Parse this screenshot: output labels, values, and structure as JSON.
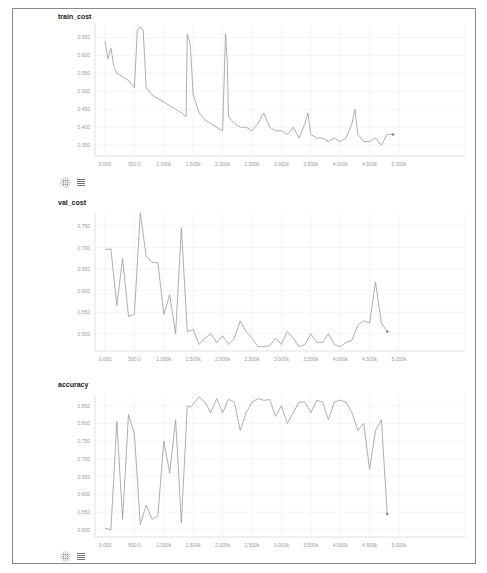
{
  "panels": [
    {
      "title": "train_cost",
      "yticks": [
        "0.650",
        "0.600",
        "0.550",
        "0.500",
        "0.450",
        "0.400",
        "0.350"
      ],
      "xticks": [
        "0.000",
        "500.0",
        "1.000k",
        "1.500k",
        "2.000k",
        "2.500k",
        "3.000k",
        "3.500k",
        "4.000k",
        "4.500k",
        "5.000k"
      ]
    },
    {
      "title": "val_cost",
      "yticks": [
        "0.750",
        "0.700",
        "0.650",
        "0.600",
        "0.550",
        "0.500"
      ],
      "xticks": [
        "0.000",
        "500.0",
        "1.000k",
        "1.500k",
        "2.000k",
        "2.500k",
        "3.000k",
        "3.500k",
        "4.000k",
        "4.500k",
        "5.000k"
      ]
    },
    {
      "title": "accuracy",
      "yticks": [
        "0.850",
        "0.800",
        "0.750",
        "0.700",
        "0.650",
        "0.600",
        "0.550",
        "0.500"
      ],
      "xticks": [
        "0.000",
        "500.0",
        "1.000k",
        "1.500k",
        "2.000k",
        "2.500k",
        "3.000k",
        "3.500k",
        "4.000k",
        "4.500k",
        "5.000k"
      ]
    }
  ],
  "icons": [
    "fit-domain-icon",
    "data-table-icon"
  ],
  "chart_data": [
    {
      "type": "line",
      "title": "train_cost",
      "xlabel": "",
      "ylabel": "",
      "xlim": [
        0,
        5000
      ],
      "ylim": [
        0.32,
        0.69
      ],
      "grid": true,
      "x": [
        0,
        50,
        100,
        150,
        200,
        300,
        400,
        500,
        550,
        600,
        650,
        700,
        800,
        900,
        1000,
        1100,
        1200,
        1300,
        1380,
        1400,
        1450,
        1500,
        1600,
        1700,
        1800,
        1900,
        2000,
        2050,
        2080,
        2100,
        2150,
        2200,
        2300,
        2400,
        2500,
        2600,
        2700,
        2800,
        2900,
        3000,
        3100,
        3200,
        3300,
        3400,
        3450,
        3500,
        3600,
        3700,
        3800,
        3900,
        4000,
        4100,
        4200,
        4250,
        4300,
        4400,
        4500,
        4600,
        4700,
        4800,
        4900
      ],
      "values": [
        0.64,
        0.59,
        0.62,
        0.57,
        0.55,
        0.54,
        0.53,
        0.51,
        0.67,
        0.68,
        0.67,
        0.51,
        0.49,
        0.48,
        0.47,
        0.46,
        0.45,
        0.44,
        0.43,
        0.66,
        0.63,
        0.49,
        0.44,
        0.42,
        0.41,
        0.4,
        0.39,
        0.66,
        0.58,
        0.43,
        0.42,
        0.41,
        0.4,
        0.4,
        0.39,
        0.41,
        0.44,
        0.4,
        0.39,
        0.39,
        0.38,
        0.4,
        0.37,
        0.41,
        0.44,
        0.38,
        0.37,
        0.37,
        0.36,
        0.37,
        0.36,
        0.37,
        0.41,
        0.45,
        0.38,
        0.36,
        0.36,
        0.37,
        0.35,
        0.38,
        0.38
      ]
    },
    {
      "type": "line",
      "title": "val_cost",
      "xlabel": "",
      "ylabel": "",
      "xlim": [
        0,
        5000
      ],
      "ylim": [
        0.46,
        0.78
      ],
      "grid": true,
      "x": [
        0,
        100,
        200,
        300,
        400,
        500,
        600,
        700,
        800,
        900,
        1000,
        1100,
        1200,
        1300,
        1400,
        1500,
        1600,
        1700,
        1800,
        1900,
        2000,
        2100,
        2200,
        2300,
        2400,
        2500,
        2600,
        2700,
        2800,
        2900,
        3000,
        3100,
        3200,
        3300,
        3400,
        3500,
        3600,
        3700,
        3800,
        3900,
        4000,
        4100,
        4200,
        4300,
        4400,
        4500,
        4600,
        4700,
        4800
      ],
      "values": [
        0.695,
        0.697,
        0.565,
        0.675,
        0.54,
        0.545,
        0.78,
        0.68,
        0.665,
        0.665,
        0.545,
        0.59,
        0.5,
        0.745,
        0.505,
        0.51,
        0.475,
        0.49,
        0.5,
        0.48,
        0.495,
        0.475,
        0.49,
        0.53,
        0.505,
        0.49,
        0.47,
        0.47,
        0.472,
        0.49,
        0.475,
        0.505,
        0.49,
        0.47,
        0.475,
        0.5,
        0.48,
        0.48,
        0.5,
        0.475,
        0.47,
        0.48,
        0.485,
        0.52,
        0.53,
        0.525,
        0.62,
        0.525,
        0.505
      ]
    },
    {
      "type": "line",
      "title": "accuracy",
      "xlabel": "",
      "ylabel": "",
      "xlim": [
        0,
        5000
      ],
      "ylim": [
        0.48,
        0.88
      ],
      "grid": true,
      "x": [
        0,
        100,
        200,
        300,
        400,
        500,
        600,
        700,
        800,
        900,
        1000,
        1100,
        1200,
        1300,
        1400,
        1450,
        1500,
        1600,
        1700,
        1800,
        1900,
        2000,
        2100,
        2200,
        2300,
        2400,
        2500,
        2600,
        2700,
        2800,
        2900,
        3000,
        3100,
        3200,
        3300,
        3400,
        3500,
        3600,
        3700,
        3800,
        3900,
        4000,
        4100,
        4200,
        4300,
        4400,
        4500,
        4600,
        4700,
        4800
      ],
      "values": [
        0.505,
        0.5,
        0.805,
        0.53,
        0.825,
        0.77,
        0.515,
        0.57,
        0.53,
        0.54,
        0.75,
        0.66,
        0.81,
        0.52,
        0.85,
        0.845,
        0.855,
        0.875,
        0.86,
        0.83,
        0.87,
        0.83,
        0.868,
        0.86,
        0.78,
        0.83,
        0.86,
        0.87,
        0.865,
        0.867,
        0.82,
        0.85,
        0.8,
        0.83,
        0.86,
        0.86,
        0.83,
        0.865,
        0.86,
        0.81,
        0.86,
        0.865,
        0.86,
        0.83,
        0.78,
        0.8,
        0.67,
        0.78,
        0.81,
        0.545
      ]
    }
  ]
}
